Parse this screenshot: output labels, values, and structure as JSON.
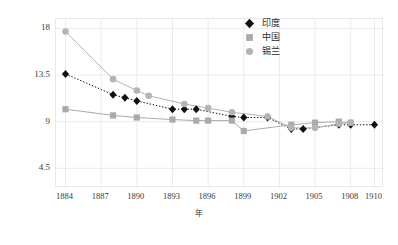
{
  "chart_data": {
    "type": "line",
    "title": "",
    "subtitle": "",
    "xlabel": "年",
    "ylabel": "",
    "x": [
      1884,
      1885,
      1886,
      1887,
      1888,
      1889,
      1890,
      1891,
      1892,
      1893,
      1894,
      1895,
      1896,
      1897,
      1898,
      1899,
      1900,
      1901,
      1902,
      1903,
      1904,
      1905,
      1906,
      1907,
      1908,
      1909,
      1910
    ],
    "xlim": [
      1883.2,
      1910.8
    ],
    "ylim": [
      2.6,
      18.9
    ],
    "xticks": [
      1884,
      1887,
      1890,
      1893,
      1896,
      1899,
      1902,
      1905,
      1908,
      1910
    ],
    "xticklabels": [
      "1884",
      "1887",
      "1890",
      "1893",
      "1896",
      "1899",
      "1902",
      "1905",
      "1908",
      "1910"
    ],
    "yticks": [
      4.5,
      9,
      13.5,
      18
    ],
    "yticklabels": [
      "4.5",
      "9",
      "13.5",
      "18"
    ],
    "grid": true,
    "grid_axis": "y",
    "legend_position": "top-right",
    "series": [
      {
        "name": "印度",
        "color": "#111111",
        "marker": "diamond",
        "linestyle": "dotted",
        "points": [
          {
            "x": 1884,
            "y": 13.6
          },
          {
            "x": 1888,
            "y": 11.6
          },
          {
            "x": 1889,
            "y": 11.3
          },
          {
            "x": 1890,
            "y": 11.0
          },
          {
            "x": 1893,
            "y": 10.2
          },
          {
            "x": 1894,
            "y": 10.2
          },
          {
            "x": 1895,
            "y": 10.2
          },
          {
            "x": 1898,
            "y": 9.5
          },
          {
            "x": 1899,
            "y": 9.4
          },
          {
            "x": 1901,
            "y": 9.4
          },
          {
            "x": 1903,
            "y": 8.3
          },
          {
            "x": 1904,
            "y": 8.3
          },
          {
            "x": 1907,
            "y": 8.7
          },
          {
            "x": 1908,
            "y": 8.7
          },
          {
            "x": 1910,
            "y": 8.7
          }
        ]
      },
      {
        "name": "中国",
        "color": "#aaaaaa",
        "marker": "square",
        "linestyle": "solid",
        "points": [
          {
            "x": 1884,
            "y": 10.2
          },
          {
            "x": 1888,
            "y": 9.6
          },
          {
            "x": 1890,
            "y": 9.4
          },
          {
            "x": 1893,
            "y": 9.2
          },
          {
            "x": 1895,
            "y": 9.1
          },
          {
            "x": 1896,
            "y": 9.1
          },
          {
            "x": 1898,
            "y": 9.1
          },
          {
            "x": 1899,
            "y": 8.1
          },
          {
            "x": 1903,
            "y": 8.7
          },
          {
            "x": 1905,
            "y": 8.9
          },
          {
            "x": 1907,
            "y": 9.0
          },
          {
            "x": 1908,
            "y": 8.9
          }
        ]
      },
      {
        "name": "锡兰",
        "color": "#b4b4b4",
        "marker": "circle",
        "linestyle": "solid",
        "points": [
          {
            "x": 1884,
            "y": 17.7
          },
          {
            "x": 1888,
            "y": 13.1
          },
          {
            "x": 1890,
            "y": 12.0
          },
          {
            "x": 1891,
            "y": 11.5
          },
          {
            "x": 1894,
            "y": 10.7
          },
          {
            "x": 1896,
            "y": 10.3
          },
          {
            "x": 1898,
            "y": 9.9
          },
          {
            "x": 1901,
            "y": 9.5
          },
          {
            "x": 1903,
            "y": 8.4
          },
          {
            "x": 1905,
            "y": 8.4
          },
          {
            "x": 1907,
            "y": 8.8
          },
          {
            "x": 1908,
            "y": 8.9
          }
        ]
      }
    ]
  },
  "legend": {
    "items": [
      {
        "label": "印度",
        "marker": "diamond",
        "color": "#111111"
      },
      {
        "label": "中国",
        "marker": "square",
        "color": "#aaaaaa"
      },
      {
        "label": "锡兰",
        "marker": "circle",
        "color": "#b4b4b4"
      }
    ]
  },
  "colors": {
    "grid": "#ebebeb",
    "frame": "#e8e8e8",
    "text": "#3a3a3a",
    "background": "#ffffff"
  }
}
